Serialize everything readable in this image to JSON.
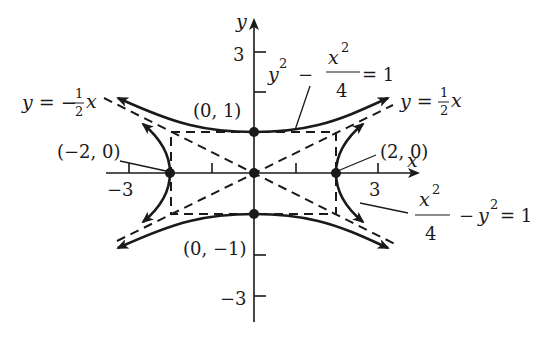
{
  "figure": {
    "type": "hyperbola-pair",
    "colors": {
      "ink": "#1a1a1a",
      "background": "#ffffff"
    },
    "axes": {
      "x_label": "x",
      "y_label": "y",
      "x_ticks": [
        {
          "value": -3,
          "label": "−3"
        },
        {
          "value": 3,
          "label": "3"
        }
      ],
      "y_ticks": [
        {
          "value": 3,
          "label": "3"
        },
        {
          "value": -3,
          "label": "−3"
        }
      ]
    },
    "points": [
      {
        "label": "(0, 1)",
        "x": 0,
        "y": 1
      },
      {
        "label": "(0, −1)",
        "x": 0,
        "y": -1
      },
      {
        "label": "(−2, 0)",
        "x": -2,
        "y": 0
      },
      {
        "label": "(2, 0)",
        "x": 2,
        "y": 0
      },
      {
        "label": "",
        "x": 0,
        "y": 0
      }
    ],
    "asymptotes": [
      {
        "lhs": "y = ",
        "sign": "",
        "num": "1",
        "den": "2",
        "var": "x",
        "equation": "y = 1/2 x"
      },
      {
        "lhs": "y = ",
        "sign": "−",
        "num": "1",
        "den": "2",
        "var": "x",
        "equation": "y = -1/2 x"
      }
    ],
    "curves": [
      {
        "name": "vertical-hyperbola",
        "equation": "y^2 - x^2/4 = 1",
        "parts": {
          "a": "y",
          "a_exp": "2",
          "minus": "−",
          "num": "x",
          "num_exp": "2",
          "den": "4",
          "rhs": "= 1"
        }
      },
      {
        "name": "horizontal-hyperbola",
        "equation": "x^2/4 - y^2 = 1",
        "parts": {
          "num": "x",
          "num_exp": "2",
          "den": "4",
          "minus": "−",
          "b": "y",
          "b_exp": "2",
          "rhs": "= 1"
        }
      }
    ],
    "dashed_rectangle": {
      "x_min": -2,
      "x_max": 2,
      "y_min": -1,
      "y_max": 1
    }
  }
}
